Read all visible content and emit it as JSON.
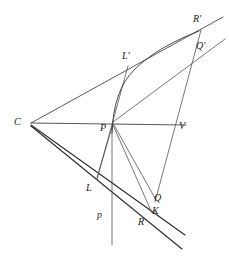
{
  "figure": {
    "background_color": "#ffffff",
    "stroke_color": "#3a3a3a",
    "width": 229,
    "height": 268,
    "labels": [
      {
        "id": "C",
        "text": "C",
        "x": 14,
        "y": 117
      },
      {
        "id": "P",
        "text": "P",
        "x": 100,
        "y": 123
      },
      {
        "id": "V",
        "text": "V",
        "x": 179,
        "y": 121
      },
      {
        "id": "Lp",
        "text": "L'",
        "x": 122,
        "y": 51
      },
      {
        "id": "Rp",
        "text": "R'",
        "x": 193,
        "y": 14
      },
      {
        "id": "Qp",
        "text": "Q'",
        "x": 196,
        "y": 41
      },
      {
        "id": "L",
        "text": "L",
        "x": 86,
        "y": 183
      },
      {
        "id": "Q",
        "text": "Q",
        "x": 154,
        "y": 193
      },
      {
        "id": "K",
        "text": "K",
        "x": 152,
        "y": 206
      },
      {
        "id": "R",
        "text": "R",
        "x": 138,
        "y": 217
      },
      {
        "id": "p",
        "text": "p",
        "x": 97,
        "y": 210
      }
    ],
    "points": {
      "C": {
        "x": 31,
        "y": 123
      },
      "P": {
        "x": 113,
        "y": 123
      },
      "V": {
        "x": 181,
        "y": 124
      },
      "Lp": {
        "x": 128,
        "y": 66
      },
      "Rp": {
        "x": 201,
        "y": 29
      },
      "Qp": {
        "x": 198,
        "y": 48
      },
      "L": {
        "x": 97,
        "y": 178
      },
      "Q": {
        "x": 156,
        "y": 199
      },
      "K": {
        "x": 152,
        "y": 212
      },
      "R": {
        "x": 150,
        "y": 214
      }
    },
    "elements": [
      {
        "name": "axis-line-CV",
        "kind": "segment"
      },
      {
        "name": "ray-C-to-Rprime",
        "kind": "ray"
      },
      {
        "name": "ray-C-to-Qprime",
        "kind": "ray"
      },
      {
        "name": "ray-C-to-K",
        "kind": "ray"
      },
      {
        "name": "ray-C-to-R",
        "kind": "ray"
      },
      {
        "name": "chord-Lprime-L",
        "kind": "segment"
      },
      {
        "name": "chord-Qprime-Q",
        "kind": "segment"
      },
      {
        "name": "segment-P-L",
        "kind": "segment"
      },
      {
        "name": "segment-P-Q",
        "kind": "segment"
      },
      {
        "name": "segment-P-K",
        "kind": "segment"
      },
      {
        "name": "ordinate-line-p",
        "kind": "line"
      },
      {
        "name": "conic-arc",
        "kind": "curve"
      }
    ]
  }
}
